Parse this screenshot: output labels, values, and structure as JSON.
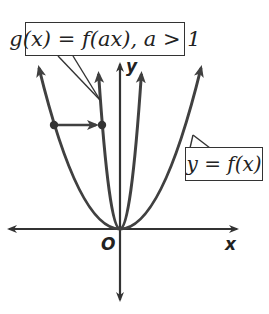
{
  "diagram": {
    "callouts": {
      "g_label": "g(x) = f(ax), a > 1",
      "f_label": "y = f(x)"
    },
    "axes": {
      "x_label": "x",
      "y_label": "y",
      "origin_label": "O"
    },
    "colors": {
      "curve": "#404040",
      "axis": "#333333",
      "text": "#222222",
      "background": "#ffffff"
    },
    "curves": [
      {
        "name": "f",
        "description": "y = f(x), wider parabola through origin"
      },
      {
        "name": "g",
        "description": "g(x) = f(ax), a > 1, narrower parabola through origin"
      }
    ],
    "mapping_arrow": {
      "description": "horizontal arrow from a point on f to the corresponding point on g at the same height"
    }
  }
}
